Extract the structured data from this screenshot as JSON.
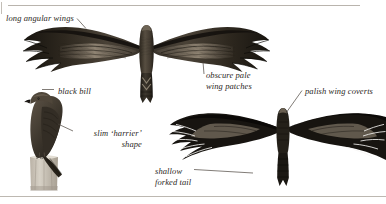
{
  "plate": {
    "kind": "field-guide-illustration-plate",
    "background_color": "#ffffff",
    "ink_color": "#2b2724",
    "border_color": "#b9b4ad",
    "width": 386,
    "height": 204
  },
  "labels": [
    {
      "id": "long-angular-wings",
      "text": "long angular wings",
      "points_to": "upper-bird-left-wing"
    },
    {
      "id": "black-bill",
      "text": "black bill",
      "points_to": "perched-bird-bill"
    },
    {
      "id": "slim-harrier-shape",
      "text": "slim ‘harrier’\nshape",
      "points_to": "perched-bird-body"
    },
    {
      "id": "obscure-pale-wing-patches",
      "text": "obscure pale\nwing patches",
      "points_to": "upper-bird-right-wing-panel"
    },
    {
      "id": "palish-wing-coverts",
      "text": "palish wing coverts",
      "points_to": "lower-bird-right-wing-coverts"
    },
    {
      "id": "shallow-forked-tail",
      "text": "shallow\nforked tail",
      "points_to": "lower-bird-tail"
    }
  ],
  "figures": [
    {
      "id": "upper-bird",
      "name": "raptor-in-flight-from-above-upper",
      "description": "soaring raptor seen from above, wings fully spread, banded pale wing panels, notched tail"
    },
    {
      "id": "perched-bird",
      "name": "raptor-perched-on-post",
      "description": "perched raptor in profile facing left, standing on a weathered fence post"
    },
    {
      "id": "lower-bird",
      "name": "raptor-in-flight-from-above-lower",
      "description": "dark soaring raptor seen from above, wings spread, pale wing coverts, shallow forked tail"
    }
  ],
  "frame": {
    "top_rule": true,
    "bottom_rule": true,
    "left_tick": true
  }
}
